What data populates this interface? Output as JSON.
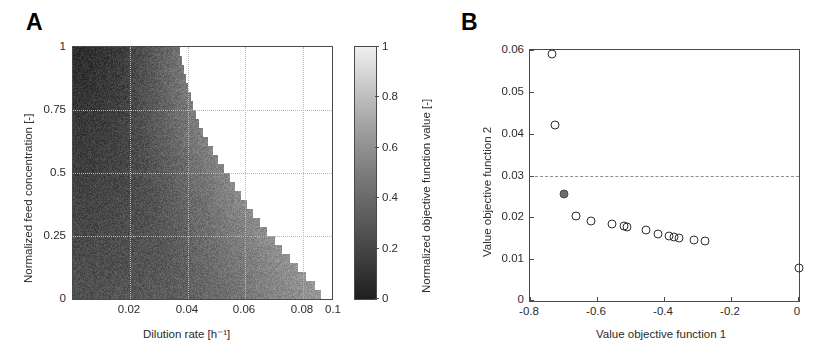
{
  "figure": {
    "panels": [
      {
        "label": "A",
        "type": "heatmap",
        "xlabel": "Dilution rate [h⁻¹]",
        "ylabel": "Normalized feed concentration [-]",
        "xticks": [
          "0.02",
          "0.04",
          "0.06",
          "0.08",
          "0.1"
        ],
        "yticks": [
          "0",
          "0.25",
          "0.5",
          "0.75",
          "1"
        ],
        "colorbar": {
          "label": "Normalized objective function value [-]",
          "ticks": [
            "0",
            "0.2",
            "0.4",
            "0.6",
            "0.8",
            "1"
          ],
          "low_color": "#1f1f1f",
          "high_color": "#efefef"
        }
      },
      {
        "label": "B",
        "type": "scatter",
        "xlabel": "Value objective function 1",
        "ylabel": "Value objective function 2",
        "xticks": [
          "-0.8",
          "-0.6",
          "-0.4",
          "-0.2",
          "0"
        ],
        "yticks": [
          "0",
          "0.01",
          "0.02",
          "0.03",
          "0.04",
          "0.05",
          "0.06"
        ]
      }
    ]
  },
  "chart_data": [
    {
      "type": "heatmap",
      "title": "A",
      "xlabel": "Dilution rate [h⁻¹]",
      "ylabel": "Normalized feed concentration [-]",
      "xlim": [
        0.01,
        0.1
      ],
      "ylim": [
        0,
        1
      ],
      "xtick_values": [
        0.02,
        0.04,
        0.06,
        0.08,
        0.1
      ],
      "ytick_values": [
        0,
        0.25,
        0.5,
        0.75,
        1
      ],
      "grid": true,
      "colorbar": {
        "label": "Normalized objective function value [-]",
        "range": [
          0,
          1
        ],
        "tick_values": [
          0,
          0.2,
          0.4,
          0.6,
          0.8,
          1
        ],
        "colormap": "gray",
        "orientation": "vertical",
        "position": "right"
      },
      "notes": "Feasible region shaded grayscale; white region at upper-right is washout (no solution). Boundary is a descending staircase from (D=0.047, S=1) to (D=0.097, S=0).",
      "washout_boundary": {
        "feed_concentration": [
          1.0,
          0.94,
          0.88,
          0.82,
          0.76,
          0.7,
          0.64,
          0.58,
          0.52,
          0.46,
          0.4,
          0.34,
          0.28,
          0.22,
          0.16,
          0.1,
          0.05,
          0.0
        ],
        "dilution_rate": [
          0.047,
          0.048,
          0.049,
          0.0505,
          0.052,
          0.0535,
          0.056,
          0.059,
          0.0625,
          0.0655,
          0.069,
          0.0725,
          0.0765,
          0.081,
          0.0855,
          0.09,
          0.0945,
          0.097
        ]
      },
      "value_field_description": "Objective value decreases (darker) toward low dilution rate and high feed concentration; minimum ~0.05 near D=0.013, S=0.95; rises toward ~0.55 near the washout boundary."
    },
    {
      "type": "scatter",
      "title": "B",
      "xlabel": "Value objective function 1",
      "ylabel": "Value objective function 2",
      "xlim": [
        -0.8,
        0.0
      ],
      "ylim": [
        0,
        0.06
      ],
      "xtick_values": [
        -0.8,
        -0.6,
        -0.4,
        -0.2,
        0
      ],
      "ytick_values": [
        0,
        0.01,
        0.02,
        0.03,
        0.04,
        0.05,
        0.06
      ],
      "grid": false,
      "reference_line": {
        "axis": "y",
        "value": 0.03,
        "style": "dashed",
        "color": "#8e8e8e"
      },
      "series": [
        {
          "name": "Pareto front (open markers)",
          "marker": "open-circle",
          "points": [
            {
              "x": -0.735,
              "y": 0.059
            },
            {
              "x": -0.726,
              "y": 0.042
            },
            {
              "x": -0.662,
              "y": 0.0204
            },
            {
              "x": -0.62,
              "y": 0.0192
            },
            {
              "x": -0.556,
              "y": 0.0184
            },
            {
              "x": -0.521,
              "y": 0.018
            },
            {
              "x": -0.511,
              "y": 0.0176
            },
            {
              "x": -0.455,
              "y": 0.0169
            },
            {
              "x": -0.42,
              "y": 0.0161
            },
            {
              "x": -0.386,
              "y": 0.0155
            },
            {
              "x": -0.371,
              "y": 0.0153
            },
            {
              "x": -0.356,
              "y": 0.0151
            },
            {
              "x": -0.312,
              "y": 0.0147
            },
            {
              "x": -0.279,
              "y": 0.0144
            },
            {
              "x": 0.0,
              "y": 0.008
            }
          ]
        },
        {
          "name": "Selected solution (filled marker)",
          "marker": "filled-circle",
          "points": [
            {
              "x": -0.7,
              "y": 0.0255
            }
          ]
        }
      ]
    }
  ]
}
